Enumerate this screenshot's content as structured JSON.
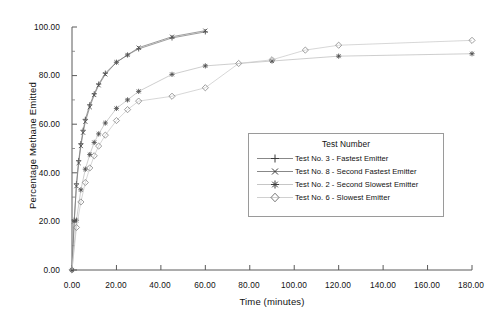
{
  "chart_data": {
    "type": "line",
    "title": "",
    "xlabel": "Time (minutes)",
    "ylabel": "Percentage Methane Emitted",
    "xlim": [
      0,
      180
    ],
    "ylim": [
      0,
      100
    ],
    "xticks": [
      "0.00",
      "20.00",
      "40.00",
      "60.00",
      "80.00",
      "100.00",
      "120.00",
      "140.00",
      "160.00",
      "180.00"
    ],
    "yticks": [
      "0.00",
      "20.00",
      "40.00",
      "60.00",
      "80.00",
      "100.00"
    ],
    "xtick_values": [
      0,
      20,
      40,
      60,
      80,
      100,
      120,
      140,
      160,
      180
    ],
    "ytick_values": [
      0,
      20,
      40,
      60,
      80,
      100
    ],
    "grid": false,
    "legend_position": "center-right",
    "legend_title": "Test Number",
    "series": [
      {
        "name": "Test No. 3 - Fastest Emitter",
        "marker": "plus",
        "color": "#4d4d4d",
        "x": [
          0,
          1,
          2,
          3,
          4,
          5,
          6,
          8,
          10,
          12,
          15,
          20,
          25,
          30,
          45,
          60
        ],
        "y": [
          0.0,
          20.5,
          35.5,
          45.0,
          52.0,
          57.5,
          62.0,
          68.0,
          72.5,
          76.5,
          81.0,
          85.5,
          88.5,
          91.0,
          95.5,
          98.0
        ]
      },
      {
        "name": "Test No. 8 - Second Fastest Emitter",
        "marker": "x",
        "color": "#4d4d4d",
        "x": [
          0,
          1,
          2,
          3,
          4,
          5,
          6,
          8,
          10,
          12,
          15,
          20,
          25,
          30,
          45,
          60
        ],
        "y": [
          0.0,
          20.0,
          34.5,
          44.0,
          51.0,
          56.5,
          61.0,
          67.0,
          72.0,
          76.0,
          80.5,
          85.5,
          88.5,
          91.5,
          96.0,
          98.5
        ]
      },
      {
        "name": "Test No. 2 - Second Slowest Emitter",
        "marker": "star",
        "color": "#4d4d4d",
        "x": [
          0,
          2,
          4,
          6,
          8,
          10,
          12,
          15,
          20,
          25,
          30,
          45,
          60,
          90,
          120,
          180
        ],
        "y": [
          0.0,
          20.5,
          33.0,
          41.5,
          47.5,
          52.5,
          56.0,
          60.5,
          66.5,
          70.0,
          73.5,
          80.5,
          84.0,
          86.0,
          88.0,
          89.0
        ]
      },
      {
        "name": "Test No. 6 - Slowest Emitter",
        "marker": "diamond",
        "color": "#8c8c8c",
        "x": [
          0,
          2,
          4,
          6,
          8,
          10,
          12,
          15,
          20,
          25,
          30,
          45,
          60,
          75,
          90,
          105,
          120,
          180
        ],
        "y": [
          0.0,
          17.5,
          28.0,
          36.0,
          42.0,
          47.0,
          51.0,
          55.5,
          61.5,
          66.0,
          69.5,
          71.5,
          75.0,
          85.0,
          86.5,
          90.5,
          92.5,
          94.5
        ]
      }
    ]
  },
  "legend": {
    "title": "Test Number",
    "entries": [
      {
        "label": "Test No. 3 - Fastest Emitter",
        "marker": "plus"
      },
      {
        "label": "Test No. 8 - Second Fastest Emitter",
        "marker": "x"
      },
      {
        "label": "Test No. 2 - Second Slowest Emitter",
        "marker": "star"
      },
      {
        "label": "Test No. 6 - Slowest Emitter",
        "marker": "diamond"
      }
    ]
  },
  "axes": {
    "x_title": "Time (minutes)",
    "y_title": "Percentage Methane Emitted",
    "x_labels": [
      "0.00",
      "20.00",
      "40.00",
      "60.00",
      "80.00",
      "100.00",
      "120.00",
      "140.00",
      "160.00",
      "180.00"
    ],
    "y_labels": [
      "0.00",
      "20.00",
      "40.00",
      "60.00",
      "80.00",
      "100.00"
    ]
  },
  "colors": {
    "axis": "#5a5a5a",
    "text": "#111111",
    "series_dark": "#4d4d4d",
    "series_light": "#8c8c8c",
    "legend_border": "#9a9a9a",
    "background": "#ffffff"
  }
}
